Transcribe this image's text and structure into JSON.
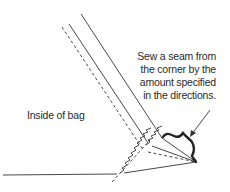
{
  "diagram": {
    "labels": {
      "inside": "Inside of bag",
      "callout_lines": [
        "Sew a seam from",
        "the corner by the",
        "amount specified",
        "in the directions."
      ]
    },
    "colors": {
      "line": "#333333",
      "background": "#ffffff"
    }
  }
}
